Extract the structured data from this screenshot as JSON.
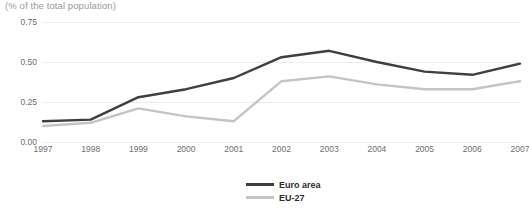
{
  "chart_data": {
    "type": "line",
    "title": "",
    "subtitle": "(% of the total population)",
    "xlabel": "",
    "ylabel": "",
    "categories": [
      "1997",
      "1998",
      "1999",
      "2000",
      "2001",
      "2002",
      "2003",
      "2004",
      "2005",
      "2006",
      "2007"
    ],
    "series": [
      {
        "name": "Euro area",
        "color": "#3f3f3f",
        "values": [
          0.13,
          0.14,
          0.28,
          0.33,
          0.4,
          0.53,
          0.57,
          0.5,
          0.44,
          0.42,
          0.49
        ]
      },
      {
        "name": "EU-27",
        "color": "#c4c4c4",
        "values": [
          0.1,
          0.12,
          0.21,
          0.16,
          0.13,
          0.38,
          0.41,
          0.36,
          0.33,
          0.33,
          0.38
        ]
      }
    ],
    "ylim": [
      0.0,
      0.75
    ],
    "yticks": [
      0.0,
      0.25,
      0.5,
      0.75
    ],
    "ytick_labels": [
      "0.00",
      "0.25",
      "0.50",
      "0.75"
    ],
    "grid": true,
    "legend_position": "bottom-center"
  },
  "colors": {
    "grid": "#ececec",
    "tick_text": "#6e6e6e",
    "subtitle_text": "#9a9a9a",
    "legend_text": "#2d2d2d"
  }
}
